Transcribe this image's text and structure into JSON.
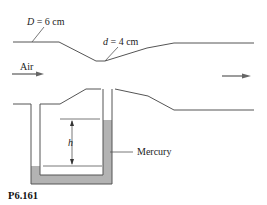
{
  "figure": {
    "label": "P6.161",
    "upstream_diameter": {
      "symbol": "D",
      "value": "= 6 cm"
    },
    "throat_diameter": {
      "symbol": "d",
      "value": "= 4 cm"
    },
    "flow_label": "Air",
    "manometer_height": "h",
    "fluid_label": "Mercury",
    "colors": {
      "line": "#555555",
      "mercury": "#b3b3b3",
      "arrow": "#666666"
    }
  }
}
